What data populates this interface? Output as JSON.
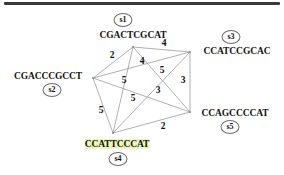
{
  "figure": {
    "type": "weighted-complete-graph",
    "background": "#ffffff",
    "line_color": "#8c8c8c",
    "text_color": "#111111",
    "highlight_color": "#eef5b8",
    "rule_color": "#3a3a3a"
  },
  "nodes": [
    {
      "id": "s1",
      "badge": "s1",
      "sequence": "CGACTCGCAT",
      "vx": 133,
      "vy": 47,
      "lx": 133,
      "ly": 35,
      "bx": 123,
      "by": 20,
      "highlight": false
    },
    {
      "id": "s2",
      "badge": "s2",
      "sequence": "CGACCCGCCT",
      "vx": 93,
      "vy": 78,
      "lx": 48,
      "ly": 76,
      "bx": 52,
      "by": 90,
      "highlight": false
    },
    {
      "id": "s3",
      "badge": "s3",
      "sequence": "CCATCCGCAC",
      "vx": 190,
      "vy": 52,
      "lx": 237,
      "ly": 51,
      "bx": 231,
      "by": 37,
      "highlight": false
    },
    {
      "id": "s4",
      "badge": "s4",
      "sequence": "CCATTCCCAT",
      "vx": 113,
      "vy": 133,
      "lx": 117,
      "ly": 144,
      "bx": 118,
      "by": 159,
      "highlight": true
    },
    {
      "id": "s5",
      "badge": "s5",
      "sequence": "CCAGCCCCAT",
      "vx": 190,
      "vy": 112,
      "lx": 235,
      "ly": 113,
      "bx": 230,
      "by": 127,
      "highlight": false
    }
  ],
  "edges": [
    {
      "from": "s1",
      "to": "s3",
      "weight": "4",
      "wx": 164,
      "wy": 43
    },
    {
      "from": "s1",
      "to": "s2",
      "weight": "2",
      "wx": 112,
      "wy": 55
    },
    {
      "from": "s1",
      "to": "s5",
      "weight": "5",
      "wx": 162,
      "wy": 70
    },
    {
      "from": "s1",
      "to": "s4",
      "weight": "4",
      "wx": 142,
      "wy": 61
    },
    {
      "from": "s2",
      "to": "s3",
      "weight": "5",
      "wx": 124,
      "wy": 80
    },
    {
      "from": "s2",
      "to": "s5",
      "weight": "5",
      "wx": 133,
      "wy": 98
    },
    {
      "from": "s2",
      "to": "s4",
      "weight": "5",
      "wx": 101,
      "wy": 110
    },
    {
      "from": "s3",
      "to": "s5",
      "weight": "3",
      "wx": 183,
      "wy": 80
    },
    {
      "from": "s3",
      "to": "s4",
      "weight": "3",
      "wx": 158,
      "wy": 90
    },
    {
      "from": "s4",
      "to": "s5",
      "weight": "2",
      "wx": 163,
      "wy": 126
    }
  ],
  "chart_data": {
    "type": "graph",
    "title": "",
    "node_ids": [
      "s1",
      "s2",
      "s3",
      "s4",
      "s5"
    ],
    "node_sequences": {
      "s1": "CGACTCGCAT",
      "s2": "CGACCCGCCT",
      "s3": "CCATCCGCAC",
      "s4": "CCATTCCCAT",
      "s5": "CCAGCCCCAT"
    },
    "edge_list": [
      [
        "s1",
        "s3",
        4
      ],
      [
        "s1",
        "s2",
        2
      ],
      [
        "s1",
        "s5",
        5
      ],
      [
        "s1",
        "s4",
        4
      ],
      [
        "s2",
        "s3",
        5
      ],
      [
        "s2",
        "s5",
        5
      ],
      [
        "s2",
        "s4",
        5
      ],
      [
        "s3",
        "s5",
        3
      ],
      [
        "s3",
        "s4",
        3
      ],
      [
        "s4",
        "s5",
        2
      ]
    ],
    "weights": [
      4,
      2,
      5,
      4,
      5,
      5,
      5,
      3,
      3,
      2
    ],
    "legend": [],
    "grid": false
  }
}
